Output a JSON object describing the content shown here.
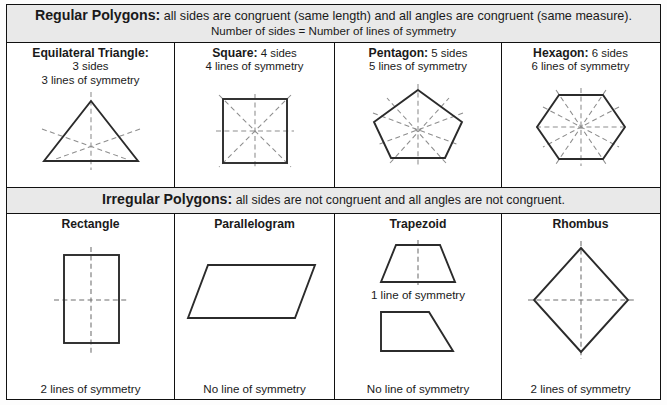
{
  "regular": {
    "banner_title": "Regular Polygons:",
    "banner_text": " all sides are congruent (same length) and all angles are congruent (same measure).",
    "banner_line2": "Number of sides = Number of lines of symmetry",
    "columns": [
      {
        "name": "Equilateral Triangle:",
        "sides": "3 sides",
        "symmetry": "3 lines of symmetry",
        "shape": "equilateral-triangle",
        "sym_lines": 3
      },
      {
        "name": "Square:",
        "sides": " 4 sides",
        "symmetry": "4 lines of symmetry",
        "shape": "square",
        "sym_lines": 4
      },
      {
        "name": "Pentagon:",
        "sides": " 5 sides",
        "symmetry": "5 lines of symmetry",
        "shape": "pentagon",
        "sym_lines": 5
      },
      {
        "name": "Hexagon:",
        "sides": " 6 sides",
        "symmetry": "6 lines of symmetry",
        "shape": "hexagon",
        "sym_lines": 6
      }
    ]
  },
  "irregular": {
    "banner_title": "Irregular Polygons:",
    "banner_text": " all sides are not congruent and all angles are not congruent.",
    "columns": [
      {
        "name": "Rectangle",
        "shape": "rectangle",
        "footer": "2 lines of symmetry",
        "sym_lines": 2
      },
      {
        "name": "Parallelogram",
        "shape": "parallelogram",
        "footer": "No line of symmetry",
        "sym_lines": 0
      },
      {
        "name": "Trapezoid",
        "shape": "isosceles-trapezoid",
        "mid_caption": "1 line of symmetry",
        "shape2": "right-trapezoid",
        "footer": "No line of symmetry",
        "sym_lines": 1
      },
      {
        "name": "Rhombus",
        "shape": "rhombus",
        "footer": "2 lines of symmetry",
        "sym_lines": 2
      }
    ]
  },
  "colors": {
    "banner_background": "#e9e9e9",
    "border": "#111111",
    "shape_stroke": "#2b2b2b",
    "symmetry_line": "#8d8d8d",
    "page_background": "#ffffff"
  }
}
